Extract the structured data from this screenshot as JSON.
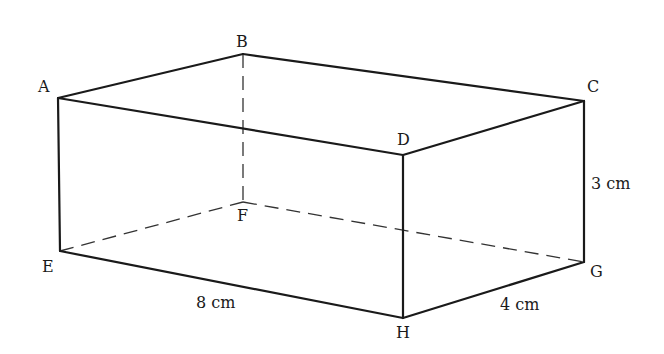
{
  "diagram": {
    "type": "rectangular prism (cuboid)",
    "vertices": {
      "A": {
        "label": "A",
        "x": 58,
        "y": 98
      },
      "B": {
        "label": "B",
        "x": 243,
        "y": 54
      },
      "C": {
        "label": "C",
        "x": 584,
        "y": 101
      },
      "D": {
        "label": "D",
        "x": 403,
        "y": 155
      },
      "E": {
        "label": "E",
        "x": 60,
        "y": 251
      },
      "F": {
        "label": "F",
        "x": 243,
        "y": 202
      },
      "G": {
        "label": "G",
        "x": 584,
        "y": 262
      },
      "H": {
        "label": "H",
        "x": 403,
        "y": 318
      }
    },
    "visible_edges": [
      "AB",
      "BC",
      "CD",
      "DA",
      "AE",
      "DH",
      "CG",
      "EH",
      "HG"
    ],
    "hidden_edges": [
      "BF",
      "EF",
      "FG"
    ],
    "dimensions": {
      "length": "8 cm",
      "width": "4 cm",
      "height": "3 cm"
    },
    "labels": {
      "A": "A",
      "B": "B",
      "C": "C",
      "D": "D",
      "E": "E",
      "F": "F",
      "G": "G",
      "H": "H",
      "length": "8 cm",
      "width": "4 cm",
      "height": "3 cm"
    }
  }
}
